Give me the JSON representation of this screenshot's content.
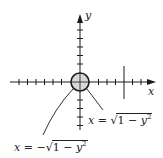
{
  "figure": {
    "type": "coordinate-plane-diagram",
    "axes": {
      "x_label": "x",
      "y_label": "y",
      "x_ticks_left": 7,
      "x_ticks_right": 6,
      "y_ticks_up": 7,
      "y_ticks_down": 6
    },
    "circle": {
      "description": "unit disk centered at origin",
      "fill": "#d8d8d8",
      "stroke": "#1a1a1a"
    },
    "vertical_line": {
      "description": "vertical segment crossing x-axis to the right of origin"
    },
    "labels": {
      "right_half": {
        "lhs": "x",
        "eq": "=",
        "sign": "",
        "radicand_1": "1",
        "minus": "−",
        "radicand_var": "y",
        "exponent": "2"
      },
      "left_half": {
        "lhs": "x",
        "eq": "=",
        "sign": "−",
        "radicand_1": "1",
        "minus": "−",
        "radicand_var": "y",
        "exponent": "2"
      }
    }
  },
  "colors": {
    "ink": "#1a1a1a",
    "disk_fill": "#d8d8d8",
    "background": "#ffffff"
  }
}
